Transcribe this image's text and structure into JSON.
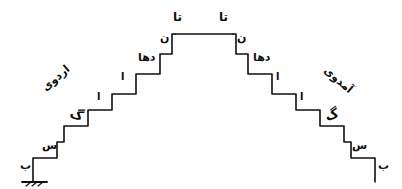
{
  "diagram": {
    "ink_color": "#0d0d0d",
    "background_color": "#fefefe",
    "ground": {
      "present": true,
      "position": "bottom-left",
      "hatch_count": 1
    },
    "slope_words": {
      "left": "اردوی",
      "right": "آمدوی"
    },
    "peak": {
      "left_top_label": "تا",
      "right_top_label": "تا",
      "left_under_label": "ن",
      "right_under_label": "ن"
    },
    "left_steps": [
      {
        "id": "L1",
        "label": "ب",
        "kind": "letter"
      },
      {
        "id": "L2",
        "label": "س",
        "kind": "letter"
      },
      {
        "id": "L3",
        "label": "گ",
        "kind": "thick-stroke"
      },
      {
        "id": "L4",
        "label": "ا",
        "kind": "stroke"
      },
      {
        "id": "L5",
        "label": "ا",
        "kind": "stroke"
      },
      {
        "id": "L6",
        "label": "دها",
        "kind": "letter"
      },
      {
        "id": "L7",
        "label": "ن",
        "kind": "letter"
      },
      {
        "id": "L8",
        "label": "تا",
        "kind": "letter"
      }
    ],
    "right_steps": [
      {
        "id": "R1",
        "label": "ب",
        "kind": "letter"
      },
      {
        "id": "R2",
        "label": "س",
        "kind": "letter"
      },
      {
        "id": "R3",
        "label": "گ",
        "kind": "thick-stroke"
      },
      {
        "id": "R4",
        "label": "ا",
        "kind": "stroke"
      },
      {
        "id": "R5",
        "label": "ا",
        "kind": "stroke"
      },
      {
        "id": "R6",
        "label": "دها",
        "kind": "letter"
      },
      {
        "id": "R7",
        "label": "ن",
        "kind": "letter"
      },
      {
        "id": "R8",
        "label": "تا",
        "kind": "letter"
      }
    ],
    "structure": {
      "shape": "staircase-pyramid",
      "side_step_count": 7,
      "symmetric": true,
      "plateau_label": "flat top between the two peak risers"
    }
  }
}
